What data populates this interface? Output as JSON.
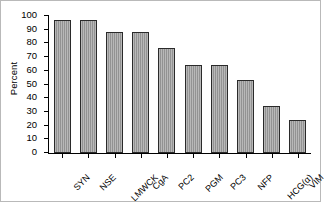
{
  "chart_data": {
    "type": "bar",
    "title": "",
    "xlabel": "",
    "ylabel": "Percent",
    "ylim": [
      0,
      100
    ],
    "ytick_values": [
      0,
      10,
      20,
      30,
      40,
      50,
      60,
      70,
      80,
      90,
      100
    ],
    "ytick_labels": [
      "0",
      "10",
      "20",
      "30",
      "40",
      "50",
      "60",
      "70",
      "80",
      "90",
      "100"
    ],
    "grid": false,
    "legend": null,
    "categories": [
      "SYN",
      "NSE",
      "LMWCK",
      "CgA",
      "PC2",
      "PGM",
      "PC3",
      "NFP",
      "HCG(α)",
      "VIM"
    ],
    "values": [
      97,
      97,
      88,
      88,
      77,
      64,
      64,
      53,
      34,
      24
    ],
    "bar_color": "#9a9a9a",
    "bar_edge_color": "#2a2a2a",
    "axis_color": "#000000",
    "background_color": "#ffffff"
  }
}
